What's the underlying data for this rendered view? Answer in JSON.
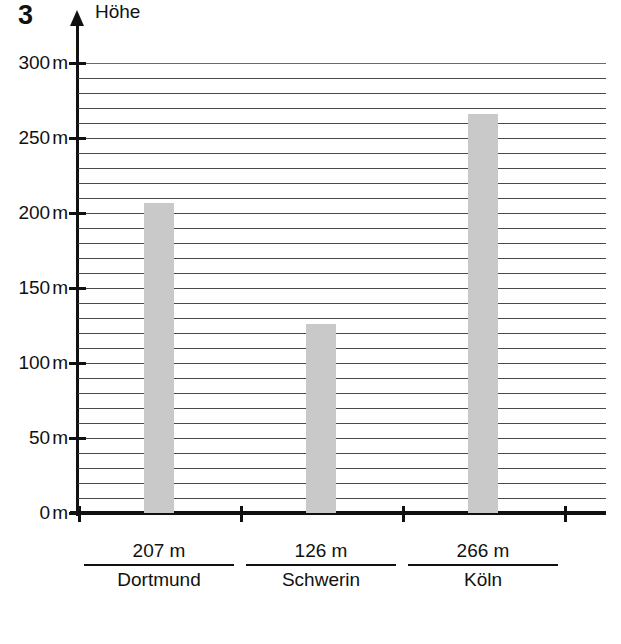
{
  "exercise": {
    "number": "3"
  },
  "chart_data": {
    "type": "bar",
    "title": "",
    "ylabel": "Höhe",
    "xlabel": "",
    "ylim": [
      0,
      300
    ],
    "y_unit": "m",
    "grid": true,
    "grid_step": 10,
    "tick_step": 50,
    "legend": "none",
    "y_ticks": [
      {
        "value": 300,
        "label": "300",
        "unit": "m"
      },
      {
        "value": 250,
        "label": "250",
        "unit": "m"
      },
      {
        "value": 200,
        "label": "200",
        "unit": "m"
      },
      {
        "value": 150,
        "label": "150",
        "unit": "m"
      },
      {
        "value": 100,
        "label": "100",
        "unit": "m"
      },
      {
        "value": 50,
        "label": "50",
        "unit": "m"
      },
      {
        "value": 0,
        "label": "0",
        "unit": "m"
      }
    ],
    "categories": [
      "Dortmund",
      "Schwerin",
      "Köln"
    ],
    "values": [
      207,
      126,
      266
    ],
    "value_labels": [
      "207 m",
      "126 m",
      "266 m"
    ],
    "bar_color": "#c9c9c9",
    "axis_color": "#111111",
    "grid_color": "#4a4a4a"
  },
  "bars": [
    {
      "name": "Dortmund",
      "value_label": "207 m",
      "value": 207
    },
    {
      "name": "Schwerin",
      "value_label": "126 m",
      "value": 126
    },
    {
      "name": "Köln",
      "value_label": "266 m",
      "value": 266
    }
  ]
}
